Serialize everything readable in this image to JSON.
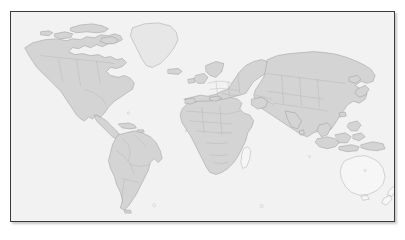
{
  "figure": {
    "type": "world-map",
    "title": "",
    "projection": "equirectangular",
    "labels_visible": false,
    "graticule_visible": false,
    "legend_visible": false,
    "antarctica_included": false
  },
  "frame": {
    "border_color": "#3a3a3a",
    "border_width_px": 1,
    "shadow": true,
    "x_px": 10,
    "y_px": 11,
    "width_px": 385,
    "height_px": 211
  },
  "canvas": {
    "background_color": "#ffffff",
    "width_px": 405,
    "height_px": 240
  },
  "colors": {
    "ocean": "#f2f2f2",
    "land_fill": "#d4d4d4",
    "land_stroke": "#9e9e9e",
    "land_light_fill": "#e7e7e7",
    "land_outline_fill": "#f6f6f6",
    "land_outline_stroke": "#b4b4b4",
    "internal_border": "#b0b0b0"
  },
  "regions": [
    {
      "name": "North America",
      "style": "filled"
    },
    {
      "name": "Greenland",
      "style": "light-filled"
    },
    {
      "name": "South America",
      "style": "filled"
    },
    {
      "name": "Africa",
      "style": "filled"
    },
    {
      "name": "Europe",
      "style": "filled"
    },
    {
      "name": "Asia",
      "style": "filled"
    },
    {
      "name": "Indonesia",
      "style": "filled"
    },
    {
      "name": "Japan",
      "style": "filled"
    },
    {
      "name": "Australia",
      "style": "outline-only"
    },
    {
      "name": "New Zealand",
      "style": "outline-only"
    },
    {
      "name": "Madagascar",
      "style": "outline-only"
    },
    {
      "name": "British Isles",
      "style": "filled"
    },
    {
      "name": "Iceland",
      "style": "filled"
    }
  ]
}
